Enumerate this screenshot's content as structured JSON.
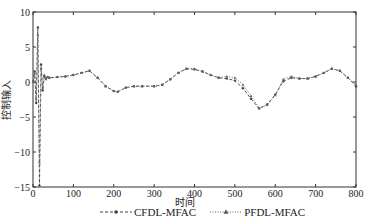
{
  "chart_data": {
    "type": "line",
    "title": "",
    "xlabel": "时间",
    "ylabel": "控制输入",
    "xlim": [
      0,
      800
    ],
    "ylim": [
      -15,
      10
    ],
    "xticks": [
      0,
      100,
      200,
      300,
      400,
      500,
      600,
      700,
      800
    ],
    "yticks": [
      -15,
      -10,
      -5,
      0,
      5,
      10
    ],
    "grid": false,
    "legend_position": "bottom",
    "series": [
      {
        "name": "CFDL-MFAC",
        "line_style": "dashed",
        "marker": "dot",
        "color": "#444444",
        "x": [
          0,
          4,
          8,
          12,
          16,
          20,
          24,
          28,
          32,
          36,
          40,
          60,
          80,
          100,
          120,
          140,
          160,
          180,
          200,
          210,
          230,
          250,
          270,
          300,
          320,
          340,
          360,
          380,
          400,
          420,
          440,
          460,
          480,
          500,
          520,
          540,
          560,
          580,
          600,
          620,
          640,
          660,
          680,
          700,
          720,
          740,
          760,
          780,
          800
        ],
        "y": [
          0,
          1.5,
          -3,
          7.8,
          -14.8,
          2.5,
          -1.2,
          0.8,
          0.5,
          0.7,
          0.6,
          0.7,
          0.8,
          1.0,
          1.3,
          1.6,
          0.6,
          -0.6,
          -1.3,
          -1.4,
          -0.8,
          -0.6,
          -0.6,
          -0.6,
          -0.4,
          0.4,
          1.3,
          1.9,
          1.8,
          1.5,
          1.0,
          0.6,
          0.5,
          0.2,
          -0.9,
          -2.4,
          -3.8,
          -3.2,
          -1.8,
          0.1,
          0.6,
          0.5,
          0.5,
          0.8,
          1.3,
          1.9,
          1.6,
          0.6,
          -0.6
        ]
      },
      {
        "name": "PFDL-MFAC",
        "line_style": "dotted",
        "marker": "triangle",
        "color": "#666666",
        "x": [
          0,
          4,
          8,
          12,
          16,
          20,
          24,
          28,
          32,
          36,
          40,
          60,
          80,
          100,
          120,
          140,
          160,
          180,
          200,
          210,
          230,
          250,
          270,
          300,
          320,
          340,
          360,
          380,
          400,
          420,
          440,
          460,
          480,
          500,
          520,
          540,
          560,
          580,
          600,
          620,
          640,
          660,
          680,
          700,
          720,
          740,
          760,
          780,
          800
        ],
        "y": [
          0,
          1.2,
          -2.5,
          6.8,
          -11.5,
          2.0,
          -0.8,
          1.0,
          0.4,
          0.7,
          0.6,
          0.7,
          0.8,
          1.0,
          1.3,
          1.6,
          0.6,
          -0.6,
          -1.3,
          -1.4,
          -0.8,
          -0.6,
          -0.6,
          -0.6,
          -0.4,
          0.4,
          1.3,
          1.9,
          1.9,
          1.5,
          1.0,
          0.6,
          0.8,
          0.6,
          -0.4,
          -2.0,
          -3.7,
          -3.3,
          -1.9,
          0.4,
          0.8,
          0.5,
          0.5,
          0.8,
          1.3,
          1.9,
          1.6,
          0.6,
          -0.4
        ]
      }
    ]
  },
  "labels": {
    "xlabel": "时间",
    "ylabel": "控制输入",
    "legend": [
      "CFDL-MFAC",
      "PFDL-MFAC"
    ]
  }
}
